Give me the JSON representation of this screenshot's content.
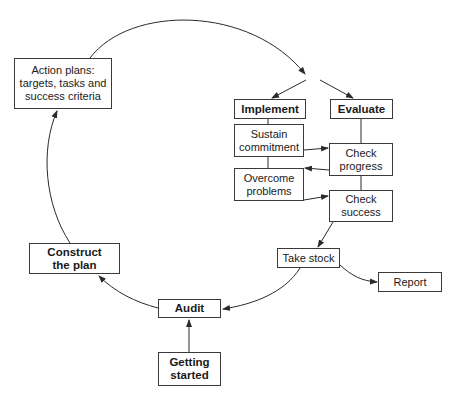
{
  "diagram": {
    "nodes": {
      "action_plans": "Action plans:\ntargets, tasks and\nsuccess criteria",
      "implement": "Implement",
      "evaluate": "Evaluate",
      "sustain_commitment": "Sustain\ncommitment",
      "overcome_problems": "Overcome\nproblems",
      "check_progress": "Check\nprogress",
      "check_success": "Check\nsuccess",
      "take_stock": "Take stock",
      "report": "Report",
      "construct_the_plan": "Construct\nthe plan",
      "audit": "Audit",
      "getting_started": "Getting\nstarted"
    },
    "edges": [
      {
        "from": "getting_started",
        "to": "audit"
      },
      {
        "from": "audit",
        "to": "construct_the_plan"
      },
      {
        "from": "construct_the_plan",
        "to": "action_plans"
      },
      {
        "from": "action_plans",
        "to": "split"
      },
      {
        "from": "split",
        "to": "implement"
      },
      {
        "from": "split",
        "to": "evaluate"
      },
      {
        "from": "implement",
        "to": "sustain_commitment"
      },
      {
        "from": "sustain_commitment",
        "to": "overcome_problems"
      },
      {
        "from": "sustain_commitment",
        "to": "check_progress"
      },
      {
        "from": "check_progress",
        "to": "overcome_problems"
      },
      {
        "from": "overcome_problems",
        "to": "check_success"
      },
      {
        "from": "evaluate",
        "to": "check_progress"
      },
      {
        "from": "check_progress",
        "to": "check_success"
      },
      {
        "from": "check_success",
        "to": "take_stock"
      },
      {
        "from": "take_stock",
        "to": "report"
      },
      {
        "from": "take_stock",
        "to": "audit"
      }
    ],
    "colors": {
      "line": "#2a2a2a",
      "box_border": "#3a3a3a",
      "background": "#ffffff"
    }
  }
}
